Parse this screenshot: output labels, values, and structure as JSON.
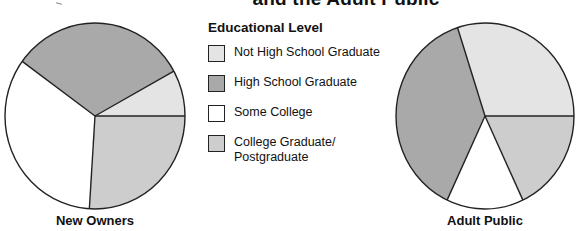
{
  "title": "and the Adult Public",
  "legend": {
    "title": "Educational Level",
    "items": [
      {
        "label": "Not High School Graduate",
        "color": "#e4e4e4"
      },
      {
        "label": "High School Graduate",
        "color": "#a9a9a9"
      },
      {
        "label": "Some College",
        "color": "#ffffff"
      },
      {
        "label": "College Graduate/ Postgraduate",
        "label_line1": "College Graduate/",
        "label_line2": "Postgraduate",
        "color": "#cdcdcd"
      }
    ]
  },
  "pies": [
    {
      "label": "New Owners"
    },
    {
      "label": "Adult Public"
    }
  ],
  "chart_data": [
    {
      "type": "pie",
      "title": "New Owners",
      "categories": [
        "Not High School Graduate",
        "High School Graduate",
        "Some College",
        "College Graduate/Postgraduate"
      ],
      "values": [
        8,
        32,
        34,
        26
      ],
      "colors": [
        "#e4e4e4",
        "#a9a9a9",
        "#ffffff",
        "#cdcdcd"
      ],
      "legend_position": "center",
      "unit": "% (estimated from slice angles)"
    },
    {
      "type": "pie",
      "title": "Adult Public",
      "categories": [
        "Not High School Graduate",
        "High School Graduate",
        "Some College",
        "College Graduate/Postgraduate"
      ],
      "values": [
        30,
        38,
        14,
        18
      ],
      "colors": [
        "#e4e4e4",
        "#a9a9a9",
        "#ffffff",
        "#cdcdcd"
      ],
      "legend_position": "center",
      "unit": "% (estimated from slice angles)"
    }
  ]
}
